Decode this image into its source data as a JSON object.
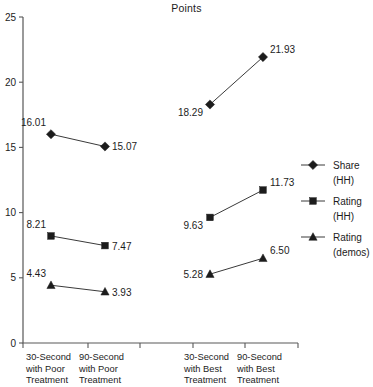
{
  "chart_data": {
    "type": "line",
    "title": "Points",
    "xlabel": "",
    "ylabel": "",
    "ylim": [
      0,
      25
    ],
    "yticks": [
      0,
      5,
      10,
      15,
      20,
      25
    ],
    "ytick_labels": [
      "0",
      "5",
      "10",
      "15",
      "20",
      "25"
    ],
    "grid": false,
    "legend_position": "right",
    "categories": [
      "30-Second with Poor Treatment",
      "90-Second with Poor Treatment",
      "30-Second with Best Treatment",
      "90-Second with Best Treatment"
    ],
    "category_lines": [
      [
        "30-Second",
        "with Poor",
        "Treatment"
      ],
      [
        "90-Second",
        "with Poor",
        "Treatment"
      ],
      [
        "30-Second",
        "with Best",
        "Treatment"
      ],
      [
        "90-Second",
        "with Best",
        "Treatment"
      ]
    ],
    "series": [
      {
        "name": "Share (HH)",
        "name_lines": [
          "Share",
          "(HH)"
        ],
        "marker": "diamond",
        "color": "#1c1c1c",
        "values": [
          16.01,
          15.07,
          18.29,
          21.93
        ],
        "value_labels": [
          "16.01",
          "15.07",
          "18.29",
          "21.93"
        ]
      },
      {
        "name": "Rating (HH)",
        "name_lines": [
          "Rating",
          "(HH)"
        ],
        "marker": "square",
        "color": "#1c1c1c",
        "values": [
          8.21,
          7.47,
          9.63,
          11.73
        ],
        "value_labels": [
          "8.21",
          "7.47",
          "9.63",
          "11.73"
        ]
      },
      {
        "name": "Rating (demos)",
        "name_lines": [
          "Rating",
          "(demos)"
        ],
        "marker": "triangle",
        "color": "#1c1c1c",
        "values": [
          4.43,
          3.93,
          5.28,
          6.5
        ],
        "value_labels": [
          "4.43",
          "3.93",
          "5.28",
          "6.50"
        ]
      }
    ],
    "label_placement": [
      [
        "left-above",
        "right",
        "left-below",
        "right-above"
      ],
      [
        "left-above",
        "right",
        "left-below",
        "right-above"
      ],
      [
        "left-above",
        "right",
        "left",
        "right-above"
      ]
    ]
  }
}
